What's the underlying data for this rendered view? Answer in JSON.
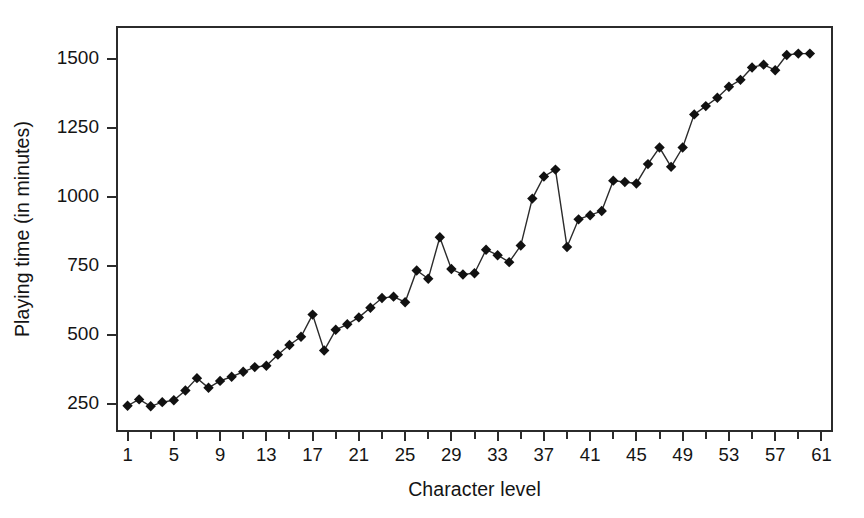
{
  "chart_data": {
    "type": "line",
    "title": "",
    "xlabel": "Character level",
    "ylabel": "Playing time (in minutes)",
    "xlim": [
      0,
      62
    ],
    "ylim": [
      150,
      1620
    ],
    "grid": false,
    "legend": "none",
    "marker": "diamond",
    "series_name": "Playing time",
    "x_tick_labels": [
      "1",
      "5",
      "9",
      "13",
      "17",
      "21",
      "25",
      "29",
      "33",
      "37",
      "41",
      "45",
      "49",
      "53",
      "57",
      "61"
    ],
    "x_tick_values": [
      1,
      5,
      9,
      13,
      17,
      21,
      25,
      29,
      33,
      37,
      41,
      45,
      49,
      53,
      57,
      61
    ],
    "x_minor_tick_values": [
      3,
      7,
      11,
      15,
      19,
      23,
      27,
      31,
      35,
      39,
      43,
      47,
      51,
      55,
      59
    ],
    "y_tick_labels": [
      "250",
      "500",
      "750",
      "1000",
      "1250",
      "1500"
    ],
    "y_tick_values": [
      250,
      500,
      750,
      1000,
      1250,
      1500
    ],
    "x": [
      1,
      2,
      3,
      4,
      5,
      6,
      7,
      8,
      9,
      10,
      11,
      12,
      13,
      14,
      15,
      16,
      17,
      18,
      19,
      20,
      21,
      22,
      23,
      24,
      25,
      26,
      27,
      28,
      29,
      30,
      31,
      32,
      33,
      34,
      35,
      36,
      37,
      38,
      39,
      40,
      41,
      42,
      43,
      44,
      45,
      46,
      47,
      48,
      49,
      50,
      51,
      52,
      53,
      54,
      55,
      56,
      57,
      58,
      59,
      60
    ],
    "values": [
      245,
      268,
      243,
      258,
      265,
      300,
      345,
      310,
      335,
      350,
      368,
      385,
      390,
      430,
      465,
      495,
      575,
      445,
      520,
      540,
      565,
      600,
      635,
      640,
      620,
      735,
      705,
      855,
      740,
      720,
      725,
      810,
      790,
      765,
      825,
      995,
      1075,
      1100,
      820,
      920,
      935,
      950,
      1060,
      1055,
      1050,
      1120,
      1180,
      1110,
      1180,
      1300,
      1330,
      1360,
      1400,
      1425,
      1470,
      1480,
      1460,
      1515,
      1520,
      1520
    ],
    "colors": {
      "line": "#2b2b2b",
      "marker": "#111111",
      "axis": "#2b2b2b",
      "text": "#141414",
      "background": "#ffffff"
    }
  }
}
